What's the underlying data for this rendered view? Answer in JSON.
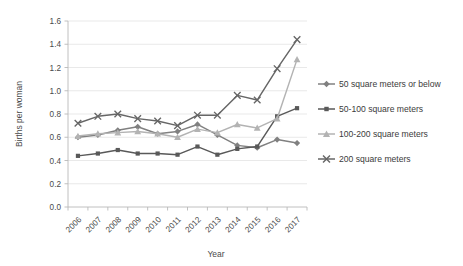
{
  "chart_data": {
    "type": "line",
    "title": "",
    "xlabel": "Year",
    "ylabel": "Births per woman",
    "categories": [
      "2006",
      "2007",
      "2008",
      "2009",
      "2010",
      "2011",
      "2012",
      "2013",
      "2014",
      "2015",
      "2016",
      "2017"
    ],
    "x": [
      2006,
      2007,
      2008,
      2009,
      2010,
      2011,
      2012,
      2013,
      2014,
      2015,
      2016,
      2017
    ],
    "ylim": [
      0.0,
      1.6
    ],
    "ytick_labels": [
      "0.0",
      "0.2",
      "0.4",
      "0.6",
      "0.8",
      "1.0",
      "1.2",
      "1.4",
      "1.6"
    ],
    "ytick_values": [
      0.0,
      0.2,
      0.4,
      0.6,
      0.8,
      1.0,
      1.2,
      1.4,
      1.6
    ],
    "grid": true,
    "legend_position": "right",
    "series": [
      {
        "name": "50 square meters or below",
        "marker": "diamond",
        "color": "#808080",
        "values": [
          0.6,
          0.62,
          0.66,
          0.69,
          0.63,
          0.65,
          0.71,
          0.62,
          0.53,
          0.51,
          0.58,
          0.55
        ]
      },
      {
        "name": "50-100 square meters",
        "marker": "square",
        "color": "#595959",
        "values": [
          0.44,
          0.46,
          0.49,
          0.46,
          0.46,
          0.45,
          0.52,
          0.45,
          0.5,
          0.52,
          0.78,
          0.85
        ]
      },
      {
        "name": "100-200 square meters",
        "marker": "triangle",
        "color": "#b3b3b3",
        "values": [
          0.61,
          0.63,
          0.64,
          0.65,
          0.63,
          0.6,
          0.67,
          0.64,
          0.71,
          0.68,
          0.76,
          1.27
        ]
      },
      {
        "name": "200 square meters",
        "marker": "cross",
        "color": "#666666",
        "values": [
          0.72,
          0.78,
          0.8,
          0.76,
          0.74,
          0.7,
          0.79,
          0.79,
          0.96,
          0.92,
          1.19,
          1.44
        ]
      }
    ]
  },
  "legend": {
    "items": [
      {
        "label": "50 square meters or below"
      },
      {
        "label": "50-100 square meters"
      },
      {
        "label": "100-200 square meters"
      },
      {
        "label": "200 square meters"
      }
    ]
  },
  "axes": {
    "y_title": "Births per woman",
    "x_title": "Year"
  }
}
